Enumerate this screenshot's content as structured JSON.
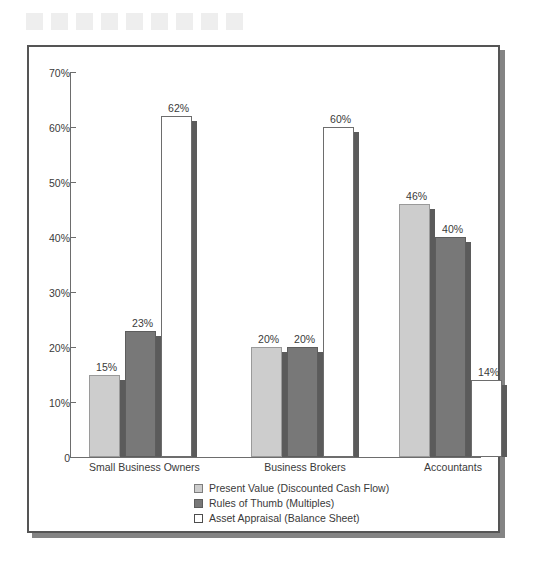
{
  "decoration": {
    "name": "top-square-strip",
    "count": 9,
    "color": "#eeeeee"
  },
  "chart_data": {
    "type": "bar",
    "title": "",
    "subtitle": "",
    "xlabel": "",
    "ylabel": "",
    "grid": false,
    "legend_position": "bottom-center",
    "ylim": [
      0,
      70
    ],
    "ytick_labels": [
      "0",
      "10%",
      "20%",
      "30%",
      "40%",
      "50%",
      "60%",
      "70%"
    ],
    "ytick_values": [
      0,
      10,
      20,
      30,
      40,
      50,
      60,
      70
    ],
    "categories": [
      "Small Business Owners",
      "Business Brokers",
      "Accountants"
    ],
    "series": [
      {
        "name": "Present Value (Discounted Cash Flow)",
        "color": "#cdcdcd",
        "values": [
          15,
          20,
          46
        ],
        "labels": [
          "15%",
          "20%",
          "46%"
        ]
      },
      {
        "name": "Rules of Thumb (Multiples)",
        "color": "#787878",
        "values": [
          23,
          20,
          40
        ],
        "labels": [
          "23%",
          "20%",
          "40%"
        ]
      },
      {
        "name": "Asset Appraisal (Balance Sheet)",
        "color": "#ffffff",
        "values": [
          62,
          60,
          14
        ],
        "labels": [
          "62%",
          "60%",
          "14%"
        ]
      }
    ]
  },
  "legend": {
    "items": [
      {
        "label": "Present Value (Discounted Cash Flow)",
        "swatch": "light-gray"
      },
      {
        "label": "Rules of Thumb (Multiples)",
        "swatch": "dark-gray"
      },
      {
        "label": "Asset Appraisal (Balance Sheet)",
        "swatch": "white"
      }
    ]
  },
  "colors": {
    "series_light": "#cdcdcd",
    "series_dark": "#787878",
    "series_white": "#ffffff",
    "axis": "#6d6d6d",
    "frame": "#555555",
    "text": "#3a3a3a",
    "shadow": "#5b5b5b",
    "decoration": "#eeeeee"
  }
}
